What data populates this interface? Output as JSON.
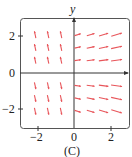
{
  "chart_data": {
    "type": "vector_field",
    "title": "",
    "caption": "(C)",
    "xlabel": "",
    "ylabel": "y",
    "xlim": [
      -3,
      3
    ],
    "ylim": [
      -3,
      3
    ],
    "xticks": [
      -2,
      0,
      2
    ],
    "yticks": [
      -2,
      0,
      2
    ],
    "xtick_labels": [
      "−2",
      "0",
      "2"
    ],
    "ytick_labels": [
      "−2",
      "0",
      "2"
    ],
    "grid": false,
    "arrow_color": "#e8555a",
    "grid_points_x": [
      -2.1,
      -1.4,
      -0.7,
      0.2,
      0.9,
      1.6,
      2.3
    ],
    "grid_points_y": [
      2.1,
      1.4,
      0.7,
      -0.7,
      -1.4,
      -2.1
    ]
  },
  "labels": {
    "y_axis": "y",
    "caption": "(C)",
    "ytick_pos2": "2",
    "ytick_0": "0",
    "ytick_neg2": "−2",
    "xtick_neg2": "−2",
    "xtick_0": "0",
    "xtick_pos2": "2"
  }
}
